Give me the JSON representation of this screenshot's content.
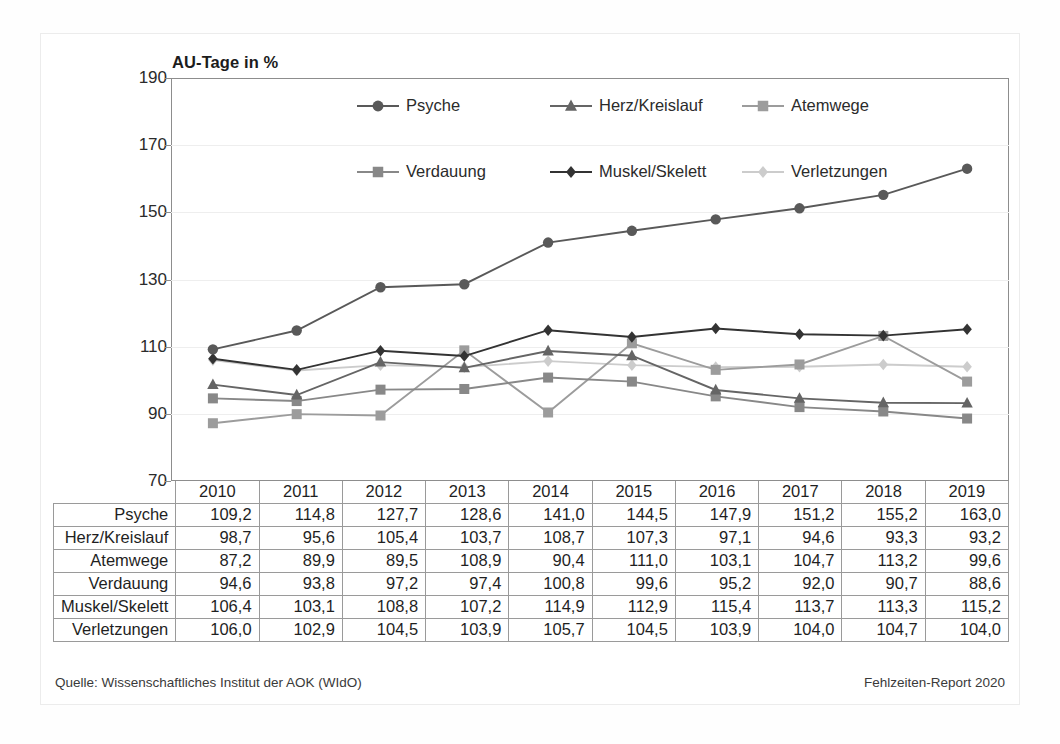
{
  "chart_data": {
    "type": "line",
    "title": "AU-Tage in %",
    "xlabel": "",
    "ylabel": "",
    "ylim": [
      70,
      190
    ],
    "yticks": [
      70,
      90,
      110,
      130,
      150,
      170,
      190
    ],
    "grid": true,
    "legend_position": "top-inside",
    "categories": [
      "2010",
      "2011",
      "2012",
      "2013",
      "2014",
      "2015",
      "2016",
      "2017",
      "2018",
      "2019"
    ],
    "series": [
      {
        "name": "Psyche",
        "marker": "circle",
        "color": "#595959",
        "values": [
          109.2,
          114.8,
          127.7,
          128.6,
          141.0,
          144.5,
          147.9,
          151.2,
          155.2,
          163.0
        ],
        "labels": [
          "109,2",
          "114,8",
          "127,7",
          "128,6",
          "141,0",
          "144,5",
          "147,9",
          "151,2",
          "155,2",
          "163,0"
        ]
      },
      {
        "name": "Herz/Kreislauf",
        "marker": "triangle",
        "color": "#656565",
        "values": [
          98.7,
          95.6,
          105.4,
          103.7,
          108.7,
          107.3,
          97.1,
          94.6,
          93.3,
          93.2
        ],
        "labels": [
          "98,7",
          "95,6",
          "105,4",
          "103,7",
          "108,7",
          "107,3",
          "97,1",
          "94,6",
          "93,3",
          "93,2"
        ]
      },
      {
        "name": "Atemwege",
        "marker": "square",
        "color": "#9c9c9c",
        "values": [
          87.2,
          89.9,
          89.5,
          108.9,
          90.4,
          111.0,
          103.1,
          104.7,
          113.2,
          99.6
        ],
        "labels": [
          "87,2",
          "89,9",
          "89,5",
          "108,9",
          "90,4",
          "111,0",
          "103,1",
          "104,7",
          "113,2",
          "99,6"
        ]
      },
      {
        "name": "Verdauung",
        "marker": "square",
        "color": "#888888",
        "values": [
          94.6,
          93.8,
          97.2,
          97.4,
          100.8,
          99.6,
          95.2,
          92.0,
          90.7,
          88.6
        ],
        "labels": [
          "94,6",
          "93,8",
          "97,2",
          "97,4",
          "100,8",
          "99,6",
          "95,2",
          "92,0",
          "90,7",
          "88,6"
        ]
      },
      {
        "name": "Muskel/Skelett",
        "marker": "diamond",
        "color": "#333333",
        "values": [
          106.4,
          103.1,
          108.8,
          107.2,
          114.9,
          112.9,
          115.4,
          113.7,
          113.3,
          115.2
        ],
        "labels": [
          "106,4",
          "103,1",
          "108,8",
          "107,2",
          "114,9",
          "112,9",
          "115,4",
          "113,7",
          "113,3",
          "115,2"
        ]
      },
      {
        "name": "Verletzungen",
        "marker": "diamond",
        "color": "#cccccc",
        "values": [
          106.0,
          102.9,
          104.5,
          103.9,
          105.7,
          104.5,
          103.9,
          104.0,
          104.7,
          104.0
        ],
        "labels": [
          "106,0",
          "102,9",
          "104,5",
          "103,9",
          "105,7",
          "104,5",
          "103,9",
          "104,0",
          "104,7",
          "104,0"
        ]
      }
    ]
  },
  "footer": {
    "source": "Quelle: Wissenschaftliches Institut der AOK (WIdO)",
    "report": "Fehlzeiten-Report 2020"
  }
}
